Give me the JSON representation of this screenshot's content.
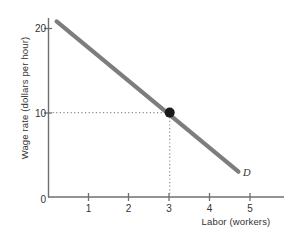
{
  "chart_data": {
    "type": "line",
    "title": "",
    "xlabel": "Labor (workers)",
    "ylabel": "Wage rate (dollars per hour)",
    "xlim": [
      0,
      5.6
    ],
    "ylim": [
      0,
      22.5
    ],
    "xticks": [
      "1",
      "2",
      "3",
      "4",
      "5"
    ],
    "xtick_values": [
      1,
      2,
      3,
      4,
      5
    ],
    "yticks": [
      "0",
      "10",
      "20"
    ],
    "ytick_values": [
      0,
      10,
      20
    ],
    "grid": false,
    "legend": "none",
    "series": [
      {
        "name": "D",
        "label": "D",
        "type": "line",
        "color": "#7d7d7d",
        "x": [
          0.2,
          4.7
        ],
        "y": [
          20.8,
          3.0
        ],
        "comment": "Labor demand curve, downward sloping"
      }
    ],
    "points": [
      {
        "name": "equilibrium",
        "x": 3,
        "y": 10,
        "color": "#1a1a1a",
        "guides": "dotted"
      }
    ],
    "annotations": [
      {
        "name": "curve-label",
        "text": "D",
        "x": 4.85,
        "y": 2.4
      }
    ]
  },
  "axes": {
    "y_title": "Wage rate (dollars per hour)",
    "x_title": "Labor (workers)",
    "y_tick_labels": [
      "20",
      "10",
      "0"
    ],
    "x_tick_labels": [
      "1",
      "2",
      "3",
      "4",
      "5"
    ]
  },
  "colors": {
    "curve": "#7d7d7d",
    "axis": "#6f6f6f",
    "point": "#1a1a1a",
    "guide": "#9a9a9a",
    "text": "#333333",
    "background": "#ffffff"
  }
}
